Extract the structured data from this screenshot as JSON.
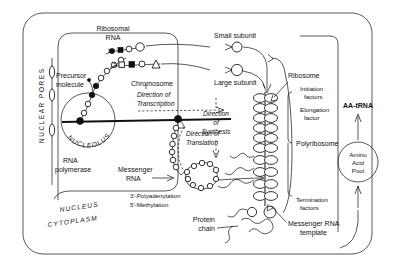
{
  "diagram": {
    "type": "biology-cell-diagram"
  },
  "labels": {
    "nuclear_pores": "NUCLEAR PORES",
    "precursor_molecule_l1": "Precursor",
    "precursor_molecule_l2": "molecule",
    "ribosomal_rna_l1": "Ribosomal",
    "ribosomal_rna_l2": "RNA",
    "chromosome": "Chromosome",
    "direction_transcription_l1": "Direction of",
    "direction_transcription_l2": "Transcription",
    "direction_translation_l1": "Direction of",
    "direction_translation_l2": "Translation",
    "nucleolus": "NUCLEOLUS",
    "rna_polymerase_l1": "RNA",
    "rna_polymerase_l2": "polymerase",
    "messenger_rna_l1": "Messenger",
    "messenger_rna_l2": "RNA",
    "polyadenylation": "3'-Polyadenylation",
    "methylation": "5'-Methylation",
    "nucleus": "NUCLEUS",
    "cytoplasm": "CYTOPLASM",
    "small_subunit": "Small subunit",
    "large_subunit": "Large subunit",
    "direction_synthesis_l1": "Direction",
    "direction_synthesis_l2": "of",
    "direction_synthesis_l3": "Synthesis",
    "ribosome": "Ribosome",
    "initiation_factors_l1": "Initiation",
    "initiation_factors_l2": "factors",
    "elongation_factor_l1": "Elongation",
    "elongation_factor_l2": "factor",
    "polyribosome": "Polyribosome",
    "termination_factors_l1": "Termination",
    "termination_factors_l2": "factors",
    "protein_chain_l1": "Protein",
    "protein_chain_l2": "chain",
    "messenger_rna_template_l1": "Messenger RNA",
    "messenger_rna_template_l2": "template",
    "aa_trna": "AA-tRNA",
    "amino_acid_pool_l1": "Amino",
    "amino_acid_pool_l2": "Acid",
    "amino_acid_pool_l3": "Pool"
  },
  "colors": {
    "ink": "#111111",
    "paper": "#ffffff"
  }
}
